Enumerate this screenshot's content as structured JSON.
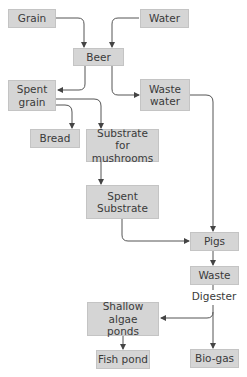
{
  "diagram": {
    "type": "flowchart",
    "nodes": {
      "grain": "Grain",
      "water": "Water",
      "beer": "Beer",
      "spent_grain": "Spent grain",
      "waste_water": "Waste water",
      "bread": "Bread",
      "substrate": "Substrate for mushrooms",
      "spent_substrate": "Spent Substrate",
      "pigs": "Pigs",
      "waste": "Waste",
      "shallow_algae": "Shallow algae ponds",
      "fish_pond": "Fish pond",
      "biogas": "Bio-gas"
    },
    "labels": {
      "digester": "Digester"
    },
    "edges": [
      {
        "from": "Grain",
        "to": "Beer"
      },
      {
        "from": "Water",
        "to": "Beer"
      },
      {
        "from": "Beer",
        "to": "Spent grain"
      },
      {
        "from": "Beer",
        "to": "Waste water"
      },
      {
        "from": "Spent grain",
        "to": "Bread"
      },
      {
        "from": "Spent grain",
        "to": "Substrate for mushrooms"
      },
      {
        "from": "Substrate for mushrooms",
        "to": "Spent Substrate"
      },
      {
        "from": "Spent Substrate",
        "to": "Pigs"
      },
      {
        "from": "Waste water",
        "to": "Pigs"
      },
      {
        "from": "Pigs",
        "to": "Waste"
      },
      {
        "from": "Waste",
        "to": "Shallow algae ponds",
        "via": "Digester"
      },
      {
        "from": "Waste",
        "to": "Bio-gas",
        "via": "Digester"
      },
      {
        "from": "Shallow algae ponds",
        "to": "Fish pond"
      }
    ],
    "colors": {
      "node_fill": "#d5d5d5",
      "edge": "#555555",
      "text": "#3a3a3a"
    }
  }
}
